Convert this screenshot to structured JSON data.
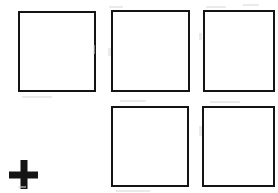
{
  "canvas": {
    "width": 278,
    "height": 193,
    "background_color": "#ffffff",
    "description": "Scanned line-art diagram: five empty open squares arranged in two rows with a bold plus sign at lower left"
  },
  "style": {
    "stroke_color": "#141414",
    "stroke_width_px": 2,
    "fill_color": "#ffffff",
    "speckle_color": "#d8d8d8"
  },
  "shapes": {
    "squares": [
      {
        "name": "square-top-left",
        "row": 1,
        "column": 1,
        "x": 18,
        "y": 11,
        "width": 78,
        "height": 81,
        "border_width": 2,
        "border_color": "#141414",
        "fill": "#ffffff",
        "label": "",
        "clipped": false
      },
      {
        "name": "square-top-middle",
        "row": 1,
        "column": 2,
        "x": 111,
        "y": 10,
        "width": 79,
        "height": 82,
        "border_width": 2,
        "border_color": "#141414",
        "fill": "#ffffff",
        "label": "",
        "clipped": false
      },
      {
        "name": "square-top-right",
        "row": 1,
        "column": 3,
        "x": 203,
        "y": 10,
        "width": 72,
        "height": 82,
        "border_width": 2,
        "border_color": "#141414",
        "fill": "#ffffff",
        "label": "",
        "clipped": true
      },
      {
        "name": "square-bottom-middle",
        "row": 2,
        "column": 2,
        "x": 111,
        "y": 106,
        "width": 78,
        "height": 81,
        "border_width": 2,
        "border_color": "#141414",
        "fill": "#ffffff",
        "label": "",
        "clipped": true
      },
      {
        "name": "square-bottom-right",
        "row": 2,
        "column": 3,
        "x": 202,
        "y": 106,
        "width": 73,
        "height": 81,
        "border_width": 2,
        "border_color": "#141414",
        "fill": "#ffffff",
        "label": "",
        "clipped": true
      }
    ],
    "plus": {
      "name": "plus-symbol",
      "glyph": "+",
      "x": 9,
      "y": 160,
      "width": 29,
      "height": 29,
      "center_x": 23,
      "center_y": 174,
      "color": "#141414",
      "stroke_thickness_px": 7
    },
    "speckles": [
      {
        "x": 93,
        "y": 45,
        "width": 2,
        "height": 9
      },
      {
        "x": 108,
        "y": 48,
        "width": 3,
        "height": 8
      },
      {
        "x": 199,
        "y": 33,
        "width": 3,
        "height": 7
      },
      {
        "x": 109,
        "y": 6,
        "width": 14,
        "height": 2
      },
      {
        "x": 206,
        "y": 6,
        "width": 20,
        "height": 2
      },
      {
        "x": 243,
        "y": 4,
        "width": 16,
        "height": 2
      },
      {
        "x": 22,
        "y": 96,
        "width": 30,
        "height": 2
      },
      {
        "x": 120,
        "y": 100,
        "width": 26,
        "height": 2
      },
      {
        "x": 210,
        "y": 101,
        "width": 30,
        "height": 2
      },
      {
        "x": 199,
        "y": 126,
        "width": 3,
        "height": 10
      },
      {
        "x": 116,
        "y": 190,
        "width": 34,
        "height": 2
      },
      {
        "x": 18,
        "y": 186,
        "width": 8,
        "height": 2
      }
    ]
  }
}
